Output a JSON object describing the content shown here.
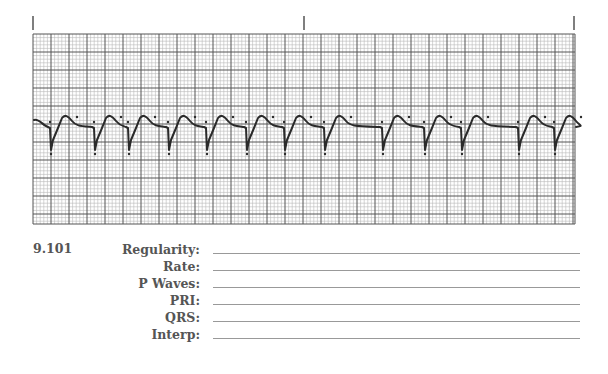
{
  "strip": {
    "markers_x": [
      33,
      304,
      574
    ],
    "grid": {
      "left": 33,
      "top": 34,
      "right": 575,
      "bottom": 224,
      "small": 3.6,
      "large": 18
    },
    "colors": {
      "minor": "#b8b8b8",
      "major": "#555555",
      "trace": "#2a2a2a"
    },
    "beat_x": [
      44,
      88,
      122,
      162,
      200,
      240,
      278,
      318,
      376,
      418,
      455,
      512,
      548
    ]
  },
  "worksheet": {
    "question_number": "9.101",
    "fields": [
      {
        "label": "Regularity:",
        "value": ""
      },
      {
        "label": "Rate:",
        "value": ""
      },
      {
        "label": "P Waves:",
        "value": ""
      },
      {
        "label": "PRI:",
        "value": ""
      },
      {
        "label": "QRS:",
        "value": ""
      },
      {
        "label": "Interp:",
        "value": ""
      }
    ]
  }
}
